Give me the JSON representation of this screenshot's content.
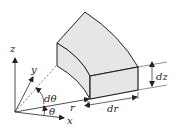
{
  "diagram": {
    "colors": {
      "face_fill": "#e6e6e6",
      "stroke": "#222222",
      "background": "#ffffff"
    },
    "labels": {
      "z": "z",
      "y": "y",
      "x": "x",
      "r": "r",
      "theta": "θ",
      "dtheta": "dθ",
      "dr": "dr",
      "dz": "dz"
    }
  }
}
